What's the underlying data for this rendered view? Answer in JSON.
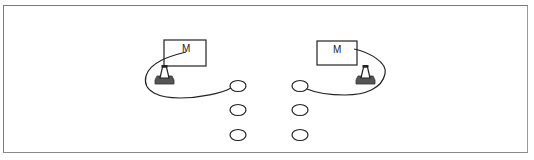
{
  "diagram": {
    "type": "setup-layout",
    "frame": {
      "stroke": "#7a7a7a"
    },
    "stations": [
      {
        "side": "left",
        "monitor": {
          "label": "M",
          "x": 164,
          "y": 40,
          "w": 42,
          "h": 26
        },
        "cone": {
          "x": 155,
          "y": 65,
          "w": 18,
          "h": 19
        },
        "cable": "M186,52 C170,56 150,62 146,76 C142,92 160,98 180,98 C200,98 222,93 231,88"
      },
      {
        "side": "right",
        "monitor": {
          "label": "M",
          "x": 317,
          "y": 41,
          "w": 40,
          "h": 24
        },
        "cone": {
          "x": 356,
          "y": 65,
          "w": 18,
          "h": 19
        },
        "cable": "M354,49 C368,52 388,62 385,74 C382,88 366,95 345,95 C328,95 314,92 307,89"
      }
    ],
    "circles": {
      "left_column": [
        {
          "cx": 238,
          "cy": 86
        },
        {
          "cx": 238,
          "cy": 110
        },
        {
          "cx": 238,
          "cy": 135
        }
      ],
      "right_column": [
        {
          "cx": 300,
          "cy": 86
        },
        {
          "cx": 300,
          "cy": 110
        },
        {
          "cx": 300,
          "cy": 135
        }
      ],
      "rx": 8,
      "ry": 5.5
    },
    "colors": {
      "line": "#222222",
      "cone_fill": "#ffffff",
      "cone_base": "#555555"
    }
  }
}
